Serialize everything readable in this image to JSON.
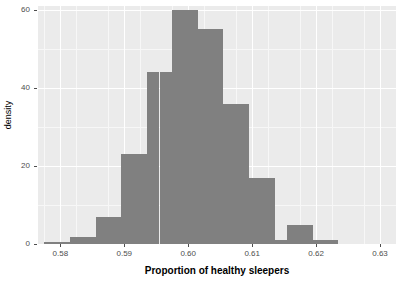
{
  "chart_data": {
    "type": "bar",
    "title": "",
    "subtitle": "",
    "xlabel": "Proportion of healthy sleepers",
    "ylabel": "density",
    "xlim": [
      0.5765,
      0.6325
    ],
    "ylim": [
      0,
      61
    ],
    "grid": true,
    "legend": "none",
    "bar_color": "#808080",
    "panel_color": "#ebebeb",
    "gridline_color": "#ffffff",
    "bin_width": 0.002,
    "xticks": [
      "0.58",
      "0.59",
      "0.60",
      "0.61",
      "0.62",
      "0.63"
    ],
    "xtick_values": [
      0.58,
      0.59,
      0.6,
      0.61,
      0.62,
      0.63
    ],
    "yticks": [
      "0",
      "20",
      "40",
      "60"
    ],
    "ytick_values": [
      0,
      20,
      40,
      60
    ],
    "bins": [
      {
        "x0": 0.5775,
        "x1": 0.5795,
        "value": 0.4
      },
      {
        "x0": 0.5795,
        "x1": 0.5815,
        "value": 0.4
      },
      {
        "x0": 0.5815,
        "x1": 0.5835,
        "value": 1.8
      },
      {
        "x0": 0.5835,
        "x1": 0.5855,
        "value": 1.8
      },
      {
        "x0": 0.5855,
        "x1": 0.5875,
        "value": 7.0
      },
      {
        "x0": 0.5875,
        "x1": 0.5895,
        "value": 7.0
      },
      {
        "x0": 0.5895,
        "x1": 0.5915,
        "value": 23.0
      },
      {
        "x0": 0.5915,
        "x1": 0.5935,
        "value": 23.0
      },
      {
        "x0": 0.5935,
        "x1": 0.5955,
        "value": 44.0
      },
      {
        "x0": 0.5955,
        "x1": 0.5975,
        "value": 44.0
      },
      {
        "x0": 0.5975,
        "x1": 0.5995,
        "value": 60.0
      },
      {
        "x0": 0.5995,
        "x1": 0.6015,
        "value": 60.0
      },
      {
        "x0": 0.6015,
        "x1": 0.6035,
        "value": 55.0
      },
      {
        "x0": 0.6035,
        "x1": 0.6055,
        "value": 55.0
      },
      {
        "x0": 0.6055,
        "x1": 0.6075,
        "value": 36.0
      },
      {
        "x0": 0.6075,
        "x1": 0.6095,
        "value": 36.0
      },
      {
        "x0": 0.6095,
        "x1": 0.6115,
        "value": 17.0
      },
      {
        "x0": 0.6115,
        "x1": 0.6135,
        "value": 17.0
      },
      {
        "x0": 0.6135,
        "x1": 0.6155,
        "value": 1.0
      },
      {
        "x0": 0.6155,
        "x1": 0.6175,
        "value": 5.0
      },
      {
        "x0": 0.6175,
        "x1": 0.6195,
        "value": 5.0
      },
      {
        "x0": 0.6195,
        "x1": 0.6215,
        "value": 1.0
      },
      {
        "x0": 0.6215,
        "x1": 0.6235,
        "value": 1.0
      }
    ],
    "minor_xticks": [
      0.5775,
      0.5825,
      0.5875,
      0.5925,
      0.5975,
      0.6025,
      0.6075,
      0.6125,
      0.6175,
      0.6225,
      0.6275
    ],
    "minor_yticks": [
      10,
      30,
      50
    ]
  }
}
